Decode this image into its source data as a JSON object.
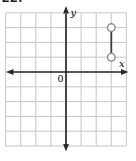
{
  "problem_number": "22.",
  "figure": {
    "x_axis_label": "x",
    "y_axis_label": "y",
    "origin_label": "0"
  },
  "chart_data": {
    "type": "line",
    "title": "",
    "x_range": [
      -4,
      4
    ],
    "y_range": [
      -5,
      4
    ],
    "grid": true,
    "axes_arrows": true,
    "series": [
      {
        "name": "segment",
        "points": [
          [
            3,
            1
          ],
          [
            3,
            3
          ]
        ],
        "endpoint_style": "open"
      }
    ]
  },
  "colors": {
    "background": "#ffffff",
    "grid": "#c6c6c6",
    "axis": "#2b2b2b",
    "segment": "#3d3d3d",
    "endpoint_stroke": "#8a8a8a",
    "endpoint_fill": "#ffffff",
    "text": "#1a1a1a"
  }
}
